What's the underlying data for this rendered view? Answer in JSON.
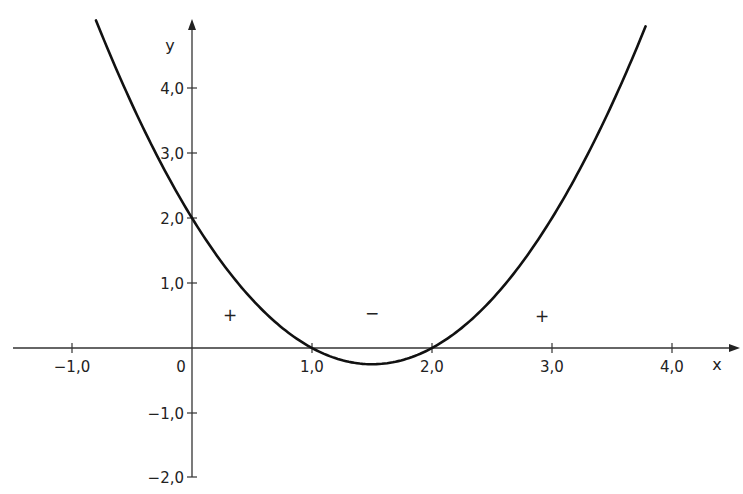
{
  "chart_data": {
    "type": "line",
    "title": "",
    "xlabel": "x",
    "ylabel": "y",
    "function": "y = (x - 1)(x - 2) = x^2 - 3x + 2",
    "series": [
      {
        "name": "parabola",
        "x": [
          -0.8,
          -0.5,
          0.0,
          0.5,
          1.0,
          1.5,
          2.0,
          2.5,
          3.0,
          3.5,
          3.78
        ],
        "y": [
          5.04,
          3.75,
          2.0,
          0.75,
          0.0,
          -0.25,
          0.0,
          0.75,
          2.0,
          3.75,
          4.95
        ]
      }
    ],
    "roots": [
      1.0,
      2.0
    ],
    "vertex": {
      "x": 1.5,
      "y": -0.25
    },
    "y_intercept": 2.0,
    "xlim": [
      -1.5,
      4.6
    ],
    "ylim": [
      -2.0,
      5.1
    ],
    "x_ticks": [
      -1.0,
      1.0,
      2.0,
      3.0,
      4.0
    ],
    "x_tick_labels": [
      "−1,0",
      "1,0",
      "2,0",
      "3,0",
      "4,0"
    ],
    "y_ticks": [
      -2.0,
      -1.0,
      1.0,
      2.0,
      3.0,
      4.0
    ],
    "y_tick_labels": [
      "−2,0",
      "−1,0",
      "1,0",
      "2,0",
      "3,0",
      "4,0"
    ],
    "origin_label": "0",
    "sign_annotations": [
      {
        "text": "+",
        "x": 0.32,
        "y": 0.5
      },
      {
        "text": "−",
        "x": 1.5,
        "y": 0.55
      },
      {
        "text": "+",
        "x": 2.92,
        "y": 0.5
      }
    ],
    "grid": false,
    "legend": "none"
  },
  "labels": {
    "x_axis": "x",
    "y_axis": "y",
    "origin": "0",
    "xt_m1": "−1,0",
    "xt_1": "1,0",
    "xt_2": "2,0",
    "xt_3": "3,0",
    "xt_4": "4,0",
    "yt_4": "4,0",
    "yt_3": "3,0",
    "yt_2": "2,0",
    "yt_1": "1,0",
    "yt_m1": "−1,0",
    "yt_m2": "−2,0",
    "sign_left": "+",
    "sign_mid": "−",
    "sign_right": "+"
  }
}
